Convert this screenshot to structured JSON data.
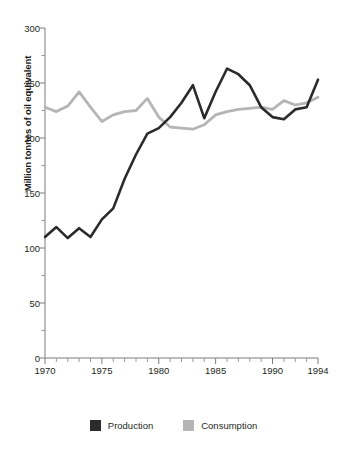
{
  "chart_data": {
    "type": "line",
    "title": "",
    "xlabel": "",
    "ylabel": "Million tonnes of oil equivalent",
    "xlim": [
      1970,
      1994
    ],
    "ylim": [
      0,
      300
    ],
    "ytick_labels": [
      "0",
      "50",
      "100",
      "150",
      "200",
      "250",
      "300"
    ],
    "ytick_values": [
      0,
      50,
      100,
      150,
      200,
      250,
      300
    ],
    "xtick_labels": [
      "1970",
      "1975",
      "1980",
      "1985",
      "1990",
      "1994"
    ],
    "xtick_values": [
      1970,
      1975,
      1980,
      1985,
      1990,
      1994
    ],
    "minor_xticks_every": 1,
    "grid": false,
    "legend_position": "bottom-center",
    "x": [
      1970,
      1971,
      1972,
      1973,
      1974,
      1975,
      1976,
      1977,
      1978,
      1979,
      1980,
      1981,
      1982,
      1983,
      1984,
      1985,
      1986,
      1987,
      1988,
      1989,
      1990,
      1991,
      1992,
      1993,
      1994
    ],
    "series": [
      {
        "name": "Production",
        "color": "#2b2b2b",
        "values": [
          110,
          119,
          109,
          118,
          110,
          126,
          136,
          163,
          185,
          204,
          209,
          219,
          232,
          248,
          218,
          242,
          263,
          258,
          248,
          228,
          219,
          217,
          226,
          228,
          253
        ]
      },
      {
        "name": "Consumption",
        "color": "#b5b5b5",
        "values": [
          228,
          224,
          229,
          242,
          228,
          215,
          221,
          224,
          225,
          236,
          219,
          210,
          209,
          208,
          212,
          221,
          224,
          226,
          227,
          228,
          226,
          234,
          230,
          232,
          237
        ]
      }
    ]
  },
  "legend": {
    "items": [
      {
        "label": "Production",
        "color": "#2b2b2b"
      },
      {
        "label": "Consumption",
        "color": "#b5b5b5"
      }
    ]
  }
}
